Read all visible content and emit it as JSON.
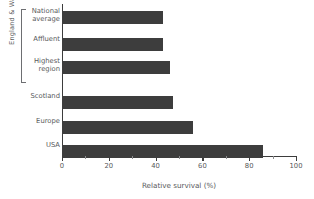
{
  "chart_data": {
    "type": "bar",
    "orientation": "horizontal",
    "title": "",
    "xlabel": "Relative survival (%)",
    "ylabel": "",
    "xlim": [
      0,
      100
    ],
    "grid": false,
    "legend": null,
    "bar_color": "#3d3d3d",
    "categories": [
      "National average",
      "Affluent",
      "Highest region",
      "Scotland",
      "Europe",
      "USA"
    ],
    "values": [
      43,
      43,
      46,
      47.5,
      56,
      86
    ],
    "group_annotations": [
      {
        "label": "England & Wales",
        "members": [
          "National average",
          "Affluent",
          "Highest region"
        ]
      }
    ],
    "xticks": [
      0,
      20,
      40,
      60,
      80,
      100
    ],
    "xtick_labels": [
      "0",
      "20",
      "40",
      "60",
      "80",
      "100"
    ],
    "xminor_ticks": [
      10,
      30,
      50,
      70,
      90
    ]
  },
  "labels": {
    "national_average": "National average",
    "affluent": "Affluent",
    "highest_region": "Highest region",
    "scotland": "Scotland",
    "europe": "Europe",
    "usa": "USA",
    "group_title": "England & Wales",
    "x_axis_title": "Relative survival (%)"
  }
}
